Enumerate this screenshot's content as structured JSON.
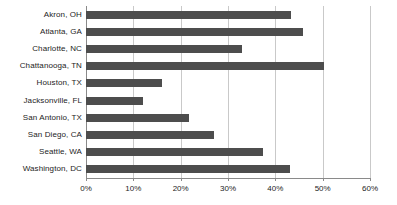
{
  "chart_data": {
    "type": "bar",
    "orientation": "horizontal",
    "title": "",
    "subtitle": "",
    "xlabel": "",
    "ylabel": "",
    "categories": [
      "Akron, OH",
      "Atlanta, GA",
      "Charlotte, NC",
      "Chattanooga, TN",
      "Houston, TX",
      "Jacksonville, FL",
      "San Antonio, TX",
      "San Diego, CA",
      "Seattle, WA",
      "Washington, DC"
    ],
    "values": [
      43.3,
      45.9,
      32.9,
      50.3,
      16.1,
      12.1,
      21.8,
      27.1,
      37.4,
      43.1
    ],
    "xlim": [
      0,
      60
    ],
    "xticks": [
      0,
      10,
      20,
      30,
      40,
      50,
      60
    ],
    "xtick_labels": [
      "0%",
      "10%",
      "20%",
      "30%",
      "40%",
      "50%",
      "60%"
    ],
    "grid": true,
    "grid_axis": "x",
    "legend": false,
    "legend_position": "none",
    "series": [
      {
        "name": "",
        "values": [
          43.3,
          45.9,
          32.9,
          50.3,
          16.1,
          12.1,
          21.8,
          27.1,
          37.4,
          43.1
        ]
      }
    ],
    "colors": {
      "bar": "#4d4d4d",
      "gridline": "#c9c9c9",
      "axis": "#8a8a8a",
      "text": "#1d1d1d",
      "background": "#ffffff"
    }
  }
}
